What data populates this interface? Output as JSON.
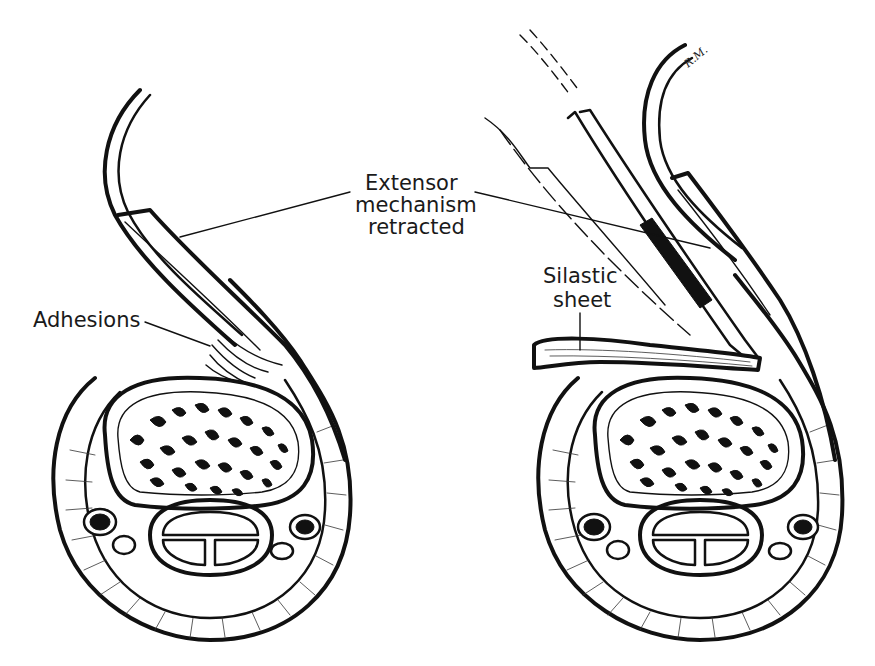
{
  "figure": {
    "type": "medical line illustration",
    "colors": {
      "ink": "#111111",
      "background": "#ffffff"
    },
    "labels": {
      "extensor_line1": "Extensor",
      "extensor_line2": "mechanism",
      "extensor_line3": "retracted",
      "adhesions": "Adhesions",
      "silastic_line1": "Silastic",
      "silastic_line2": "sheet",
      "signature": "R.M."
    },
    "panels": [
      {
        "id": "left",
        "content": "cross-section with adhesions beneath retracted extensor mechanism"
      },
      {
        "id": "right",
        "content": "cross-section with retractor and silastic sheet inserted"
      }
    ]
  }
}
